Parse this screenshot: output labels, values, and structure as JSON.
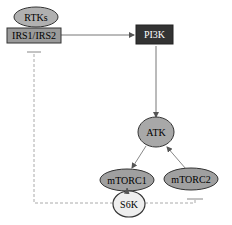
{
  "diagram": {
    "nodes": {
      "rtks": {
        "label": "RTKs",
        "fill": "#b0b0b0",
        "shape": "ellipse"
      },
      "irs": {
        "label": "IRS1/IRS2",
        "fill": "#9a9a9a",
        "shape": "rect"
      },
      "pi3k": {
        "label": "PI3K",
        "fill": "#333333",
        "text_color": "#ffffff",
        "shape": "rect"
      },
      "atk": {
        "label": "ATK",
        "fill": "#a8a8a8",
        "shape": "ellipse"
      },
      "mtorc1": {
        "label": "mTORC1",
        "fill": "#a0a0a0",
        "shape": "ellipse"
      },
      "mtorc2": {
        "label": "mTORC2",
        "fill": "#a0a0a0",
        "shape": "ellipse"
      },
      "s6k": {
        "label": "S6K",
        "fill": "#eeeeee",
        "shape": "ellipse"
      }
    },
    "edges": [
      {
        "from": "IRS1/IRS2",
        "to": "PI3K",
        "type": "activation"
      },
      {
        "from": "PI3K",
        "to": "ATK",
        "type": "activation"
      },
      {
        "from": "ATK",
        "to": "mTORC1",
        "type": "activation"
      },
      {
        "from": "mTORC2",
        "to": "ATK",
        "type": "activation"
      },
      {
        "from": "mTORC1",
        "to": "S6K",
        "type": "activation"
      },
      {
        "from": "S6K",
        "to": "IRS1/IRS2",
        "type": "inhibition",
        "style": "dashed"
      },
      {
        "from": "S6K",
        "to": "mTORC2",
        "type": "inhibition",
        "style": "dashed"
      }
    ]
  }
}
